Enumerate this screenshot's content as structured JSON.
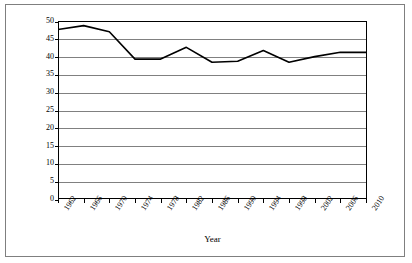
{
  "chart_data": {
    "type": "line",
    "title": "",
    "xlabel": "Year",
    "ylabel": "Percent Turnout",
    "grid": "horizontal",
    "legend": "none",
    "xlim": [
      1962,
      2010
    ],
    "ylim": [
      0,
      50
    ],
    "ytick_step": 5,
    "ytick_labels": [
      "50",
      "45",
      "40",
      "35",
      "30",
      "25",
      "20",
      "15",
      "10",
      "5",
      "0"
    ],
    "ytick_values": [
      50,
      45,
      40,
      35,
      30,
      25,
      20,
      15,
      10,
      5,
      0
    ],
    "xtick_labels": [
      "1962",
      "1966",
      "1970",
      "1974",
      "1978",
      "1982",
      "1986",
      "1990",
      "1994",
      "1998",
      "2002",
      "2006",
      "2010"
    ],
    "categories": [
      1962,
      1966,
      1970,
      1974,
      1978,
      1982,
      1986,
      1990,
      1994,
      1998,
      2002,
      2006,
      2010
    ],
    "values": [
      47.6,
      48.7,
      47.0,
      39.3,
      39.3,
      42.6,
      38.4,
      38.7,
      41.7,
      38.4,
      40.0,
      41.2,
      41.2
    ],
    "series": [
      {
        "name": "Percent Turnout",
        "color": "#000000",
        "values": [
          47.6,
          48.7,
          47.0,
          39.3,
          39.3,
          42.6,
          38.4,
          38.7,
          41.7,
          38.4,
          40.0,
          41.2,
          41.2
        ]
      }
    ]
  },
  "axes": {
    "y_title": "Percent Turnout",
    "x_title": "Year"
  },
  "colors": {
    "series_line": "#000000",
    "gridline": "#808080",
    "plot_border": "#000000",
    "outer_frame": "#7f7f7f",
    "background": "#ffffff"
  }
}
